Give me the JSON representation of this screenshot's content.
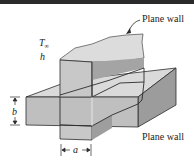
{
  "diagram": {
    "labels": {
      "top_wall": "Plane wall",
      "bottom_wall": "Plane wall",
      "t_inf": "T",
      "t_inf_sub": "∞",
      "h": "h",
      "b": "b",
      "a": "a"
    },
    "colors": {
      "top_face": "#d9d9d9",
      "front_face": "#bdbdbd",
      "side_face": "#9e9e9e",
      "outline": "#2b2b2b"
    }
  }
}
